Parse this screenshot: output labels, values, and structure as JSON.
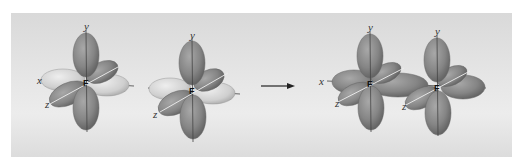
{
  "figure": {
    "colors": {
      "background": "#e4e4e4",
      "lobe_dark": "#8a8a8a",
      "lobe_light": "#c9c9c9",
      "axis": "#333333"
    },
    "atoms": [
      {
        "label": "F",
        "axes": {
          "x": "x",
          "y": "y",
          "z": "z"
        }
      },
      {
        "label": "F",
        "axes": {
          "y": "y",
          "z": "z"
        }
      }
    ],
    "product_atoms": [
      {
        "label": "F",
        "axes": {
          "x": "x",
          "y": "y",
          "z": "z"
        }
      },
      {
        "label": "F",
        "axes": {
          "y": "y",
          "z": "z"
        }
      }
    ],
    "arrow": "reaction-arrow"
  }
}
